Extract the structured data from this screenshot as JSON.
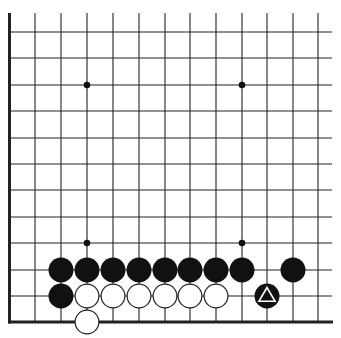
{
  "board": {
    "description": "Go diagram, lower-left corner section",
    "edges": {
      "left": true,
      "bottom": true,
      "top": false,
      "right": false
    },
    "columns_x": [
      9.5,
      35,
      61,
      87,
      113,
      139,
      165,
      190,
      216,
      242,
      267,
      293,
      318
    ],
    "rows_y": [
      32,
      58,
      85,
      111,
      138,
      164,
      190,
      217,
      243,
      270,
      296,
      322
    ],
    "line_top": 13,
    "line_right": 332,
    "star_points": [
      [
        3,
        2
      ],
      [
        9,
        2
      ],
      [
        3,
        8
      ],
      [
        9,
        8
      ]
    ],
    "stone_radius": 12.5,
    "colors": {
      "line": "#222222",
      "black": "#111111",
      "white": "#ffffff",
      "background": "#ffffff"
    }
  },
  "stones": [
    {
      "color": "black",
      "col": 2,
      "row": 9
    },
    {
      "color": "black",
      "col": 3,
      "row": 9
    },
    {
      "color": "black",
      "col": 4,
      "row": 9
    },
    {
      "color": "black",
      "col": 5,
      "row": 9
    },
    {
      "color": "black",
      "col": 6,
      "row": 9
    },
    {
      "color": "black",
      "col": 7,
      "row": 9
    },
    {
      "color": "black",
      "col": 8,
      "row": 9
    },
    {
      "color": "black",
      "col": 9,
      "row": 9
    },
    {
      "color": "black",
      "col": 11,
      "row": 9
    },
    {
      "color": "black",
      "col": 2,
      "row": 10
    },
    {
      "color": "white",
      "col": 3,
      "row": 10
    },
    {
      "color": "white",
      "col": 4,
      "row": 10
    },
    {
      "color": "white",
      "col": 5,
      "row": 10
    },
    {
      "color": "white",
      "col": 6,
      "row": 10
    },
    {
      "color": "white",
      "col": 7,
      "row": 10
    },
    {
      "color": "white",
      "col": 8,
      "row": 10
    },
    {
      "color": "black",
      "col": 10,
      "row": 10,
      "marker": "triangle"
    },
    {
      "color": "white",
      "col": 3,
      "row": 11
    }
  ]
}
